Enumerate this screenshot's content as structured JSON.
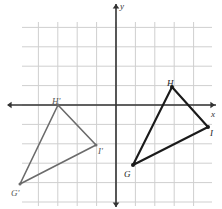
{
  "figure": {
    "grid": {
      "origin_px": [
        116,
        105
      ],
      "cell_px": 19.4,
      "x_min_px": 22,
      "x_max_px": 212,
      "y_min_px": 22,
      "y_max_px": 206,
      "grid_color": "#cfcfcf",
      "axis_color": "#333333"
    },
    "axes": {
      "x_label": "x",
      "y_label": "y",
      "x_arrow_left": true,
      "x_arrow_right": true,
      "y_arrow_up": true,
      "y_arrow_down": true
    },
    "shapes": [
      {
        "name": "triangle-ghi",
        "stroke": "#1a1a1a",
        "stroke_width": 2.1,
        "vertices": [
          {
            "label": "G",
            "px": [
              133,
              165
            ],
            "label_px": [
              124,
              170
            ]
          },
          {
            "label": "H",
            "px": [
              172,
              87
            ],
            "label_px": [
              167,
              79
            ]
          },
          {
            "label": "I",
            "px": [
              208,
              127
            ],
            "label_px": [
              210,
              129
            ]
          }
        ]
      },
      {
        "name": "triangle-ghi-prime",
        "stroke": "#6b6b6b",
        "stroke_width": 1.6,
        "vertices": [
          {
            "label": "G'",
            "px": [
              20,
              184
            ],
            "label_px": [
              11,
              189
            ]
          },
          {
            "label": "H'",
            "px": [
              58,
              105
            ],
            "label_px": [
              52,
              97
            ]
          },
          {
            "label": "I'",
            "px": [
              96,
              145
            ],
            "label_px": [
              98,
              147
            ]
          }
        ]
      }
    ]
  }
}
